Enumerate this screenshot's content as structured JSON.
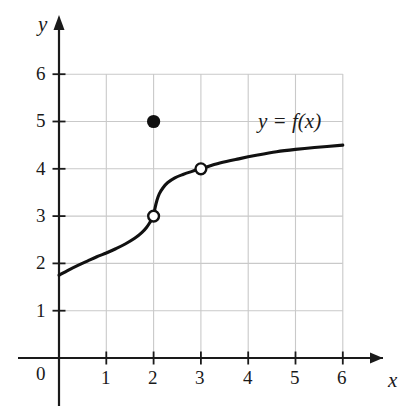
{
  "figure": {
    "kind": "cartesian-graph",
    "background_color": "#ffffff",
    "ink_color": "#1a1a1a",
    "grid_color": "#c9c9c9"
  },
  "axes": {
    "x_axis_name": "x",
    "y_axis_name": "y",
    "origin_label": "0",
    "x_tick_labels": [
      "1",
      "2",
      "3",
      "4",
      "5",
      "6"
    ],
    "y_tick_labels": [
      "1",
      "2",
      "3",
      "4",
      "5",
      "6"
    ],
    "x_ticks": [
      1,
      2,
      3,
      4,
      5,
      6
    ],
    "y_ticks": [
      1,
      2,
      3,
      4,
      5,
      6
    ],
    "xlim": [
      0,
      6.6
    ],
    "ylim": [
      0,
      6.6
    ],
    "grid": true,
    "arrowheads": [
      "x-positive",
      "y-positive"
    ]
  },
  "annotations": {
    "curve_label": "y = f(x)",
    "curve_label_x": 4.1,
    "curve_label_y": 5.0
  },
  "chart_data": {
    "type": "line",
    "title": "",
    "xlabel": "x",
    "ylabel": "y",
    "xlim": [
      0,
      6.6
    ],
    "ylim": [
      0,
      6.6
    ],
    "grid": true,
    "legend": "none",
    "annotations": [
      "y = f(x)"
    ],
    "series": [
      {
        "name": "f(x) left branch",
        "style": "solid",
        "points": [
          [
            0.0,
            1.75
          ],
          [
            0.2,
            1.86
          ],
          [
            0.4,
            1.96
          ],
          [
            0.6,
            2.05
          ],
          [
            0.8,
            2.14
          ],
          [
            1.0,
            2.22
          ],
          [
            1.2,
            2.31
          ],
          [
            1.4,
            2.41
          ],
          [
            1.6,
            2.53
          ],
          [
            1.75,
            2.65
          ],
          [
            1.85,
            2.76
          ],
          [
            1.93,
            2.88
          ],
          [
            1.98,
            2.96
          ],
          [
            2.0,
            3.0
          ]
        ]
      },
      {
        "name": "f(x) right branch",
        "style": "solid",
        "points": [
          [
            2.0,
            3.0
          ],
          [
            2.03,
            3.17
          ],
          [
            2.07,
            3.33
          ],
          [
            2.12,
            3.47
          ],
          [
            2.2,
            3.6
          ],
          [
            2.3,
            3.71
          ],
          [
            2.45,
            3.81
          ],
          [
            2.62,
            3.88
          ],
          [
            2.8,
            3.94
          ],
          [
            3.0,
            4.0
          ],
          [
            3.4,
            4.12
          ],
          [
            3.8,
            4.21
          ],
          [
            4.2,
            4.29
          ],
          [
            4.6,
            4.36
          ],
          [
            5.0,
            4.41
          ],
          [
            5.4,
            4.45
          ],
          [
            6.0,
            4.5
          ]
        ]
      }
    ],
    "open_points": [
      {
        "label": "open circle at (2, 3)",
        "x": 2,
        "y": 3
      },
      {
        "label": "open circle at (3, 4)",
        "x": 3,
        "y": 4
      }
    ],
    "closed_points": [
      {
        "label": "filled dot at (2, 5)",
        "x": 2,
        "y": 5
      }
    ]
  }
}
